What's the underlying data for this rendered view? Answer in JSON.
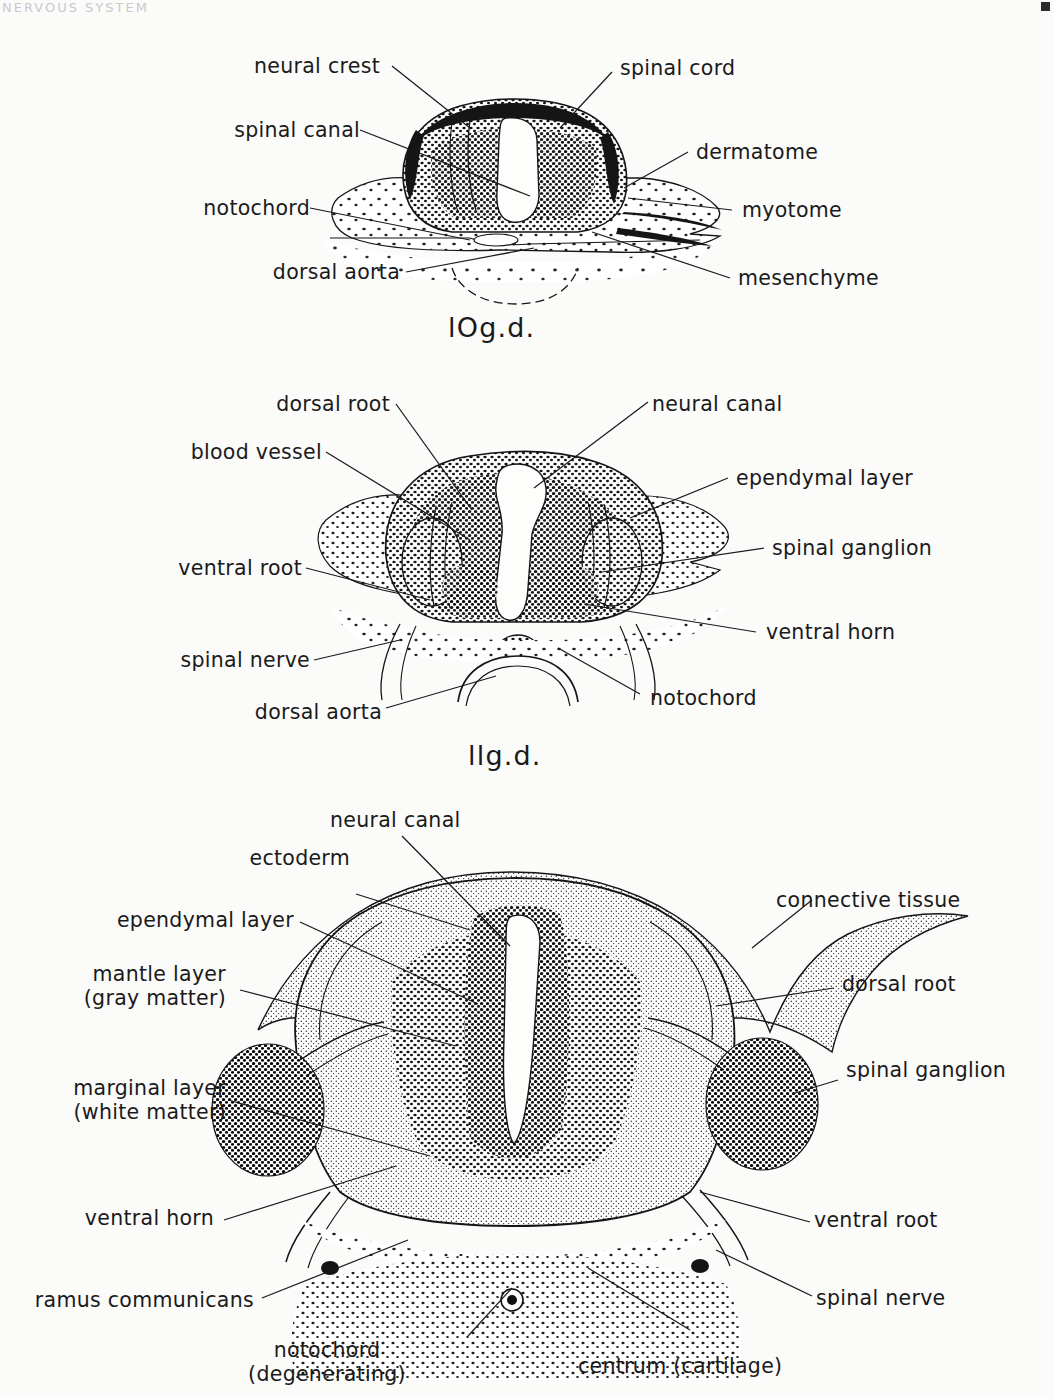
{
  "page": {
    "corner_text": "NERVOUS SYSTEM",
    "page_number": "2"
  },
  "figures": [
    {
      "id": "fig-10gd",
      "caption": "lOg.d.",
      "caption_meaning": "10 gestation days",
      "labels_left": [
        {
          "name": "neural-crest",
          "text": "neural crest"
        },
        {
          "name": "spinal-canal",
          "text": "spinal canal"
        },
        {
          "name": "notochord",
          "text": "notochord"
        },
        {
          "name": "dorsal-aorta",
          "text": "dorsal aorta"
        }
      ],
      "labels_right": [
        {
          "name": "spinal-cord",
          "text": "spinal cord"
        },
        {
          "name": "dermatome",
          "text": "dermatome"
        },
        {
          "name": "myotome",
          "text": "myotome"
        },
        {
          "name": "mesenchyme",
          "text": "mesenchyme"
        }
      ]
    },
    {
      "id": "fig-11gd",
      "caption": "llg.d.",
      "caption_meaning": "11 gestation days",
      "labels_left": [
        {
          "name": "dorsal-root",
          "text": "dorsal root"
        },
        {
          "name": "blood-vessel",
          "text": "blood vessel"
        },
        {
          "name": "ventral-root",
          "text": "ventral root"
        },
        {
          "name": "spinal-nerve",
          "text": "spinal nerve"
        },
        {
          "name": "dorsal-aorta",
          "text": "dorsal aorta"
        }
      ],
      "labels_right": [
        {
          "name": "neural-canal",
          "text": "neural canal"
        },
        {
          "name": "ependymal-layer",
          "text": "ependymal layer"
        },
        {
          "name": "spinal-ganglion",
          "text": "spinal ganglion"
        },
        {
          "name": "ventral-horn",
          "text": "ventral horn"
        },
        {
          "name": "notochord",
          "text": "notochord"
        }
      ]
    },
    {
      "id": "fig-mature",
      "caption": "",
      "labels_top": [
        {
          "name": "neural-canal",
          "text": "neural canal"
        }
      ],
      "labels_left": [
        {
          "name": "ectoderm",
          "text": "ectoderm"
        },
        {
          "name": "ependymal-layer",
          "text": "ependymal layer"
        },
        {
          "name": "mantle-layer",
          "text": "mantle layer\n(gray matter)"
        },
        {
          "name": "marginal-layer",
          "text": "marginal layer\n(white matter)"
        },
        {
          "name": "ventral-horn",
          "text": "ventral horn"
        },
        {
          "name": "ramus-communicans",
          "text": "ramus communicans"
        }
      ],
      "labels_right": [
        {
          "name": "connective-tissue",
          "text": "connective tissue"
        },
        {
          "name": "dorsal-root",
          "text": "dorsal root"
        },
        {
          "name": "spinal-ganglion",
          "text": "spinal ganglion"
        },
        {
          "name": "ventral-root",
          "text": "ventral root"
        },
        {
          "name": "spinal-nerve",
          "text": "spinal nerve"
        }
      ],
      "labels_bottom": [
        {
          "name": "notochord-degenerating",
          "text": "notochord\n(degenerating)"
        },
        {
          "name": "centrum-cartilage",
          "text": "centrum (cartilage)"
        }
      ]
    }
  ]
}
